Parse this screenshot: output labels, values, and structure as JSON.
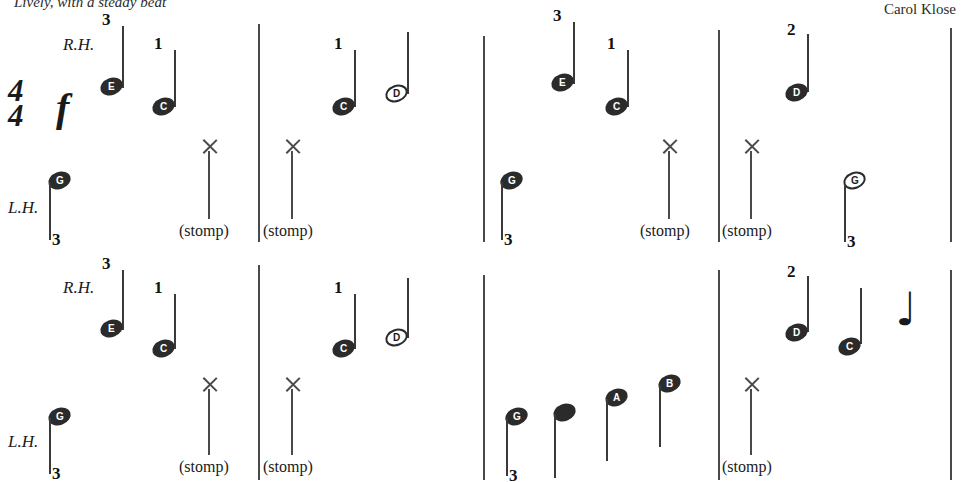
{
  "header": {
    "tempo": "Lively, with a steady beat",
    "composer": "Carol Klose"
  },
  "score": {
    "time_signature": {
      "beats": "4",
      "unit": "4"
    },
    "dynamic": "f",
    "hand_labels": {
      "right": "R.H.",
      "left": "L.H."
    },
    "stomp_label": "(stomp)",
    "rest_glyph": "♩"
  },
  "systems": [
    {
      "name": "system-1",
      "right_hand": [
        {
          "letter": "E",
          "finger": "3",
          "head": "filled"
        },
        {
          "letter": "C",
          "finger": "1",
          "head": "filled"
        },
        {
          "letter": "C",
          "finger": "1",
          "head": "filled"
        },
        {
          "letter": "D",
          "finger": "",
          "head": "hollow"
        },
        {
          "letter": "E",
          "finger": "3",
          "head": "filled"
        },
        {
          "letter": "C",
          "finger": "1",
          "head": "filled"
        },
        {
          "letter": "D",
          "finger": "2",
          "head": "filled"
        }
      ],
      "left_hand": [
        {
          "letter": "G",
          "finger": "3",
          "head": "filled"
        },
        {
          "letter": "G",
          "finger": "3",
          "head": "filled"
        },
        {
          "letter": "G",
          "finger": "3",
          "head": "hollow"
        }
      ],
      "stomps": 4
    },
    {
      "name": "system-2",
      "right_hand": [
        {
          "letter": "E",
          "finger": "3",
          "head": "filled"
        },
        {
          "letter": "C",
          "finger": "1",
          "head": "filled"
        },
        {
          "letter": "C",
          "finger": "1",
          "head": "filled"
        },
        {
          "letter": "D",
          "finger": "",
          "head": "hollow"
        },
        {
          "letter": "D",
          "finger": "2",
          "head": "filled"
        },
        {
          "letter": "C",
          "finger": "",
          "head": "filled"
        }
      ],
      "left_hand": [
        {
          "letter": "G",
          "finger": "3",
          "head": "filled"
        },
        {
          "letter": "G",
          "finger": "3",
          "head": "filled"
        },
        {
          "letter": "",
          "finger": "",
          "head": "plain"
        },
        {
          "letter": "A",
          "finger": "",
          "head": "filled"
        },
        {
          "letter": "B",
          "finger": "",
          "head": "filled"
        }
      ],
      "stomps": 3
    }
  ]
}
